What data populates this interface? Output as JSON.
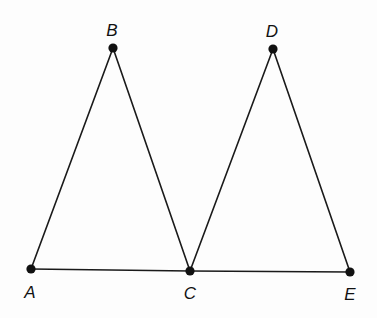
{
  "diagram": {
    "type": "geometry",
    "points": [
      {
        "id": "A",
        "label": "A",
        "x": 31,
        "y": 269,
        "label_x": 30,
        "label_y": 298
      },
      {
        "id": "B",
        "label": "B",
        "x": 113,
        "y": 48,
        "label_x": 112,
        "label_y": 36
      },
      {
        "id": "C",
        "label": "C",
        "x": 190,
        "y": 271,
        "label_x": 190,
        "label_y": 299
      },
      {
        "id": "D",
        "label": "D",
        "x": 273,
        "y": 49,
        "label_x": 272,
        "label_y": 37
      },
      {
        "id": "E",
        "label": "E",
        "x": 350,
        "y": 272,
        "label_x": 350,
        "label_y": 300
      }
    ],
    "segments": [
      {
        "from": "A",
        "to": "B"
      },
      {
        "from": "B",
        "to": "C"
      },
      {
        "from": "A",
        "to": "C"
      },
      {
        "from": "C",
        "to": "D"
      },
      {
        "from": "D",
        "to": "E"
      },
      {
        "from": "C",
        "to": "E"
      }
    ],
    "colors": {
      "line": "#1a1a1a",
      "point": "#111111",
      "background": "#fdfdfd"
    }
  }
}
